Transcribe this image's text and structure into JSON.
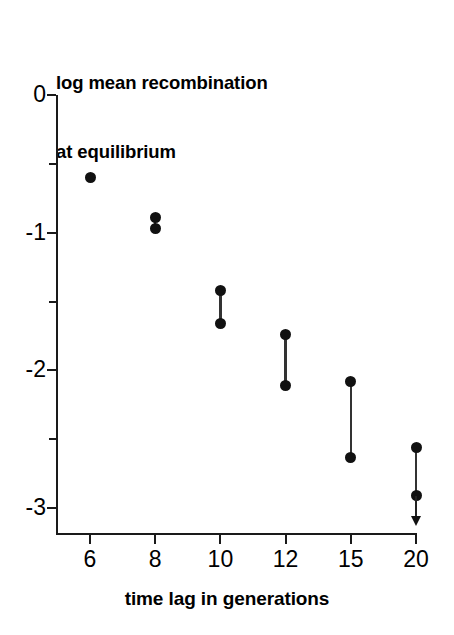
{
  "chart_data": {
    "type": "scatter",
    "title": "log mean recombination at equilibrium",
    "title_lines": [
      "log mean recombination",
      "at equilibrium"
    ],
    "xlabel": "time lag in generations",
    "ylabel": "log mean recombination at equilibrium",
    "grid": false,
    "legend": null,
    "x_scale": "categorical",
    "categories": [
      "6",
      "8",
      "10",
      "12",
      "15",
      "20"
    ],
    "x_tick_labels": [
      "6",
      "8",
      "10",
      "12",
      "15",
      "20"
    ],
    "y_tick_labels": [
      "0",
      "-1",
      "-2",
      "-3"
    ],
    "y_tick_values": [
      0,
      -1,
      -2,
      -3
    ],
    "y_minor_tick_values": [
      -0.5,
      -1.5,
      -2.5
    ],
    "ylim": [
      -3.2,
      0
    ],
    "series": [
      {
        "name": "upper bound",
        "values": [
          -0.6,
          -0.89,
          -1.42,
          -1.74,
          -2.08,
          -2.56
        ]
      },
      {
        "name": "lower bound",
        "values": [
          -0.6,
          -0.97,
          -1.66,
          -2.11,
          -2.63,
          -2.91
        ]
      }
    ],
    "points": [
      {
        "category": "6",
        "x_index": 0,
        "values": [
          -0.6
        ],
        "connected": false,
        "arrow_down": false
      },
      {
        "category": "8",
        "x_index": 1,
        "values": [
          -0.89,
          -0.97
        ],
        "connected": true,
        "arrow_down": false
      },
      {
        "category": "10",
        "x_index": 2,
        "values": [
          -1.42,
          -1.66
        ],
        "connected": true,
        "arrow_down": false
      },
      {
        "category": "12",
        "x_index": 3,
        "values": [
          -1.74,
          -2.11
        ],
        "connected": true,
        "arrow_down": false
      },
      {
        "category": "15",
        "x_index": 4,
        "values": [
          -2.08,
          -2.63
        ],
        "connected": true,
        "arrow_down": false
      },
      {
        "category": "20",
        "x_index": 5,
        "values": [
          -2.56,
          -2.91
        ],
        "connected": true,
        "arrow_down": true
      }
    ],
    "annotations": [
      {
        "name": "downward-arrow",
        "category": "20",
        "from": -2.91,
        "to": -3.12,
        "meaning": "value extends below axis"
      }
    ],
    "colors": {
      "marker": "#111111",
      "line": "#333333",
      "axis": "#1a1a1a",
      "background": "#ffffff",
      "text": "#000000"
    }
  },
  "axis": {
    "y_ticks": [
      {
        "label": "0",
        "value": 0
      },
      {
        "label": "-1",
        "value": -1
      },
      {
        "label": "-2",
        "value": -2
      },
      {
        "label": "-3",
        "value": -3
      }
    ],
    "x_ticks": [
      {
        "label": "6",
        "index": 0
      },
      {
        "label": "8",
        "index": 1
      },
      {
        "label": "10",
        "index": 2
      },
      {
        "label": "12",
        "index": 3
      },
      {
        "label": "15",
        "index": 4
      },
      {
        "label": "20",
        "index": 5
      }
    ]
  }
}
